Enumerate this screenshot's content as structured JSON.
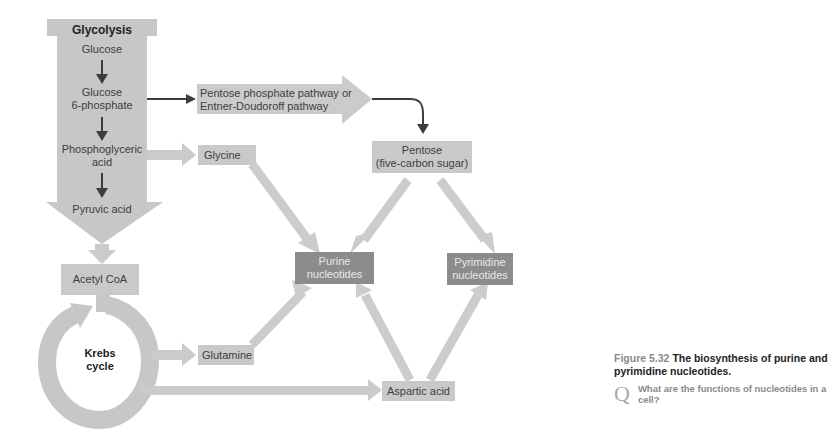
{
  "diagram": {
    "glycolysis": {
      "title": "Glycolysis",
      "steps": [
        "Glucose",
        "Glucose 6-phosphate",
        "Phosphoglyceric acid",
        "Pyruvic acid"
      ],
      "glucose": "Glucose",
      "g6p_line1": "Glucose",
      "g6p_line2": "6-phosphate",
      "pga_line1": "Phosphoglyceric",
      "pga_line2": "acid",
      "pyruvic": "Pyruvic acid"
    },
    "acetyl_coa": "Acetyl CoA",
    "krebs_line1": "Krebs",
    "krebs_line2": "cycle",
    "pentose_pathway_line1": "Pentose phosphate pathway or",
    "pentose_pathway_line2": "Entner-Doudoroff pathway",
    "pentose_line1": "Pentose",
    "pentose_line2": "(five-carbon sugar)",
    "glycine": "Glycine",
    "glutamine": "Glutamine",
    "aspartic_acid": "Aspartic acid",
    "purine_line1": "Purine",
    "purine_line2": "nucleotides",
    "pyrimidine_line1": "Pyrimidine",
    "pyrimidine_line2": "nucleotides"
  },
  "caption": {
    "figure_number": "Figure 5.32",
    "title": "The biosynthesis of purine and pyrimidine nucleotides.",
    "question_mark": "Q",
    "question": "What are the functions of nucleotides in a cell?"
  },
  "colors": {
    "light_box": "#c9c9c9",
    "dark_box": "#8c8c8c",
    "arrow_fill": "#cccccc",
    "dark_arrow": "#3d3d3d"
  }
}
